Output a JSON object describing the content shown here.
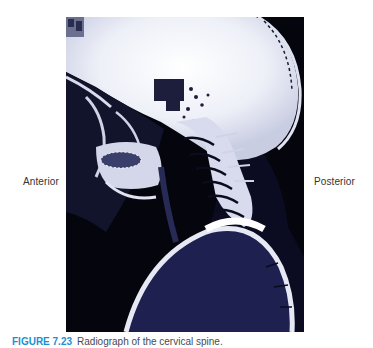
{
  "figure": {
    "image_description": "Lateral radiograph of the head and cervical spine",
    "orientation_labels": {
      "left": "Anterior",
      "right": "Posterior"
    },
    "caption": {
      "number": "FIGURE 7.23",
      "text": "Radiograph of the cervical spine."
    },
    "colors": {
      "caption_number": "#1c8fd0",
      "caption_text": "#444a55",
      "image_background": "#05050d",
      "soft_tissue": "#1e2050",
      "bone": "#e6e8f4"
    }
  }
}
